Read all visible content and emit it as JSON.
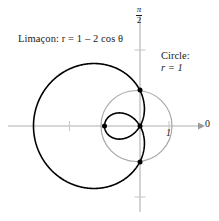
{
  "figure": {
    "width": 219,
    "height": 221,
    "background": "#ffffff"
  },
  "labels": {
    "limacon": "Limaçon: r = 1 – 2 cos θ",
    "limacon_prefix": "Limaçon:",
    "limacon_equation": "r = 1 – 2 cos θ",
    "circle_title": "Circle:",
    "circle_equation": "r = 1",
    "axis_polar_zero": "0",
    "axis_tick_one": "1",
    "axis_pi_over_two_numerator": "π",
    "axis_pi_over_two_denominator": "2"
  },
  "colors": {
    "limacon": "#000000",
    "circle": "#a8a8a8",
    "axis": "#b0b0b0",
    "tick": "#c9c9c9",
    "text": "#1a1a1a",
    "background": "#ffffff"
  },
  "chart_data": {
    "type": "line",
    "subtype": "polar",
    "title": "",
    "xlabel": "",
    "ylabel": "",
    "grid": false,
    "legend_position": "inline-annotations",
    "pole_px": {
      "x": 140,
      "y": 126
    },
    "pixels_per_unit": 35.5,
    "xlim": [
      -3.0,
      1.3
    ],
    "ylim": [
      -2.0,
      2.0
    ],
    "axes": {
      "polar_axis_label": "0",
      "polar_axis_direction": "right",
      "vertical_axis_label": "π/2",
      "x_ticks": [
        -2,
        1
      ],
      "y_ticks": [
        2,
        -2
      ]
    },
    "series": [
      {
        "name": "Limaçon: r = 1 – 2 cos θ",
        "equation": "r = 1 - 2*cos(theta)",
        "color": "#000000",
        "line_width": 1.6,
        "theta_range_deg": [
          0,
          360
        ],
        "features": {
          "outer_loop_extent_x": [
            -3,
            0
          ],
          "inner_loop_extent_x": [
            0,
            1
          ],
          "r_max": 3,
          "r_at_theta_0": -1,
          "r_at_theta_pi": 3,
          "zeros_theta_deg": [
            60,
            300
          ]
        },
        "sample_points_polar": [
          {
            "theta_deg": 0,
            "r": -1
          },
          {
            "theta_deg": 30,
            "r": -0.732
          },
          {
            "theta_deg": 60,
            "r": 0
          },
          {
            "theta_deg": 90,
            "r": 1
          },
          {
            "theta_deg": 120,
            "r": 2
          },
          {
            "theta_deg": 150,
            "r": 2.732
          },
          {
            "theta_deg": 180,
            "r": 3
          },
          {
            "theta_deg": 210,
            "r": 2.732
          },
          {
            "theta_deg": 240,
            "r": 2
          },
          {
            "theta_deg": 270,
            "r": 1
          },
          {
            "theta_deg": 300,
            "r": 0
          },
          {
            "theta_deg": 330,
            "r": -0.732
          },
          {
            "theta_deg": 360,
            "r": -1
          }
        ]
      },
      {
        "name": "Circle: r = 1",
        "equation": "r = 1",
        "color": "#a8a8a8",
        "line_width": 1.2,
        "theta_range_deg": [
          0,
          360
        ],
        "features": {
          "radius": 1,
          "center_polar": [
            0,
            0
          ]
        }
      }
    ],
    "intersection_points": [
      {
        "label": "",
        "theta_deg": 90,
        "r": 1,
        "px": {
          "x": 140,
          "y": 90
        }
      },
      {
        "label": "",
        "theta_deg": 270,
        "r": 1,
        "px": {
          "x": 140,
          "y": 162
        }
      },
      {
        "label": "pole",
        "theta_deg": 0,
        "r": 0,
        "px": {
          "x": 140,
          "y": 126
        }
      },
      {
        "label": "inner-loop-vertex",
        "theta_deg": 0,
        "r": -1,
        "px": {
          "x": 104.5,
          "y": 126
        }
      }
    ]
  }
}
